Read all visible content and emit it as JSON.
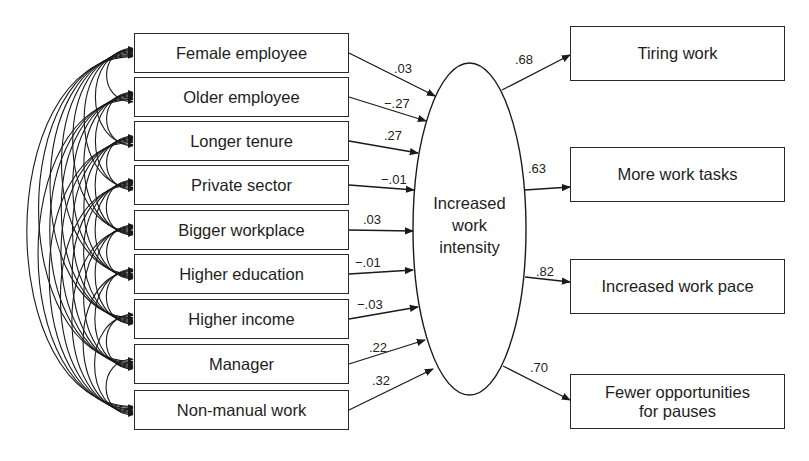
{
  "figure": {
    "type": "structural-equation-path-diagram",
    "latent_variable": {
      "label_lines": [
        "Increased",
        "work",
        "intensity"
      ]
    },
    "predictors": [
      {
        "label": "Female employee",
        "coef": ".03"
      },
      {
        "label": "Older employee",
        "coef": "−.27"
      },
      {
        "label": "Longer tenure",
        "coef": ".27"
      },
      {
        "label": "Private sector",
        "coef": "−.01"
      },
      {
        "label": "Bigger workplace",
        "coef": ".03"
      },
      {
        "label": "Higher education",
        "coef": "−.01"
      },
      {
        "label": "Higher income",
        "coef": "−.03"
      },
      {
        "label": "Manager",
        "coef": ".22"
      },
      {
        "label": "Non-manual work",
        "coef": ".32"
      }
    ],
    "indicators": [
      {
        "label": "Tiring work",
        "loading": ".68"
      },
      {
        "label": "More work tasks",
        "loading": ".63"
      },
      {
        "label": "Increased work pace",
        "loading": ".82"
      },
      {
        "label": "Fewer opportunities for pauses",
        "label_lines": [
          "Fewer opportunities",
          "for pauses"
        ],
        "loading": ".70"
      }
    ],
    "correlations": "all pairwise covariances among the 9 predictors (curved double-headed arrows)",
    "colors": {
      "line": "#1a1a1a",
      "background": "#ffffff"
    }
  }
}
